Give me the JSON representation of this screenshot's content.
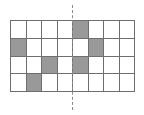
{
  "figure": {
    "grid": {
      "columns": 8,
      "rows": 4,
      "cell_fill_color": "#999999",
      "cell_empty_color": "#ffffff",
      "grid_line_color": "#6e6e6e",
      "shaded_cells": [
        {
          "row": 1,
          "col": 5
        },
        {
          "row": 2,
          "col": 1
        },
        {
          "row": 2,
          "col": 6
        },
        {
          "row": 3,
          "col": 3
        },
        {
          "row": 3,
          "col": 5
        },
        {
          "row": 4,
          "col": 2
        }
      ],
      "cells": [
        [
          0,
          0,
          0,
          0,
          1,
          0,
          0,
          0
        ],
        [
          1,
          0,
          0,
          0,
          0,
          1,
          0,
          0
        ],
        [
          0,
          0,
          1,
          0,
          1,
          0,
          0,
          0
        ],
        [
          0,
          1,
          0,
          0,
          0,
          0,
          0,
          0
        ]
      ]
    },
    "symmetry_line": {
      "orientation": "vertical",
      "style": "dashed",
      "color": "#8a8a8a",
      "position_after_column": 4
    }
  }
}
